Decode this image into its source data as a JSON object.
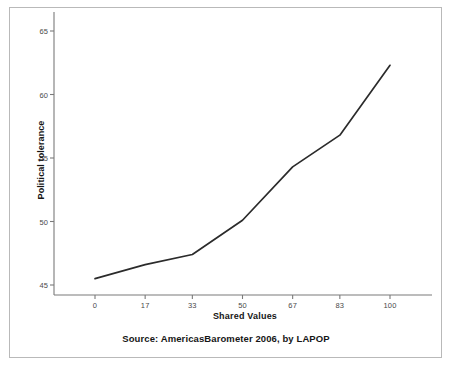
{
  "figure": {
    "source_note": "Source: AmericasBarometer 2006, by LAPOP",
    "frame_color": "#b9b9b9",
    "background": "#ffffff"
  },
  "chart_data": {
    "type": "line",
    "title": "",
    "subtitle": "",
    "xlabel": "Shared Values",
    "ylabel": "Political tolerance",
    "x": [
      0,
      17,
      33,
      50,
      67,
      83,
      100
    ],
    "values": [
      45.5,
      46.6,
      47.4,
      50.1,
      54.3,
      56.8,
      62.3
    ],
    "series": [
      {
        "name": "Political tolerance",
        "values": [
          45.5,
          46.6,
          47.4,
          50.1,
          54.3,
          56.8,
          62.3
        ],
        "color": "#2b2b2b"
      }
    ],
    "xtick_labels": [
      "0",
      "17",
      "33",
      "50",
      "67",
      "83",
      "100"
    ],
    "xticks": [
      0,
      17,
      33,
      50,
      67,
      83,
      100
    ],
    "ytick_labels": [
      "45",
      "50",
      "55",
      "60",
      "65"
    ],
    "yticks": [
      45,
      50,
      55,
      60,
      65
    ],
    "xlim": [
      -10,
      112
    ],
    "ylim": [
      43.5,
      66.2
    ],
    "grid": false,
    "legend": false,
    "legend_position": "none",
    "annotations": [
      "Source: AmericasBarometer 2006, by LAPOP"
    ]
  }
}
